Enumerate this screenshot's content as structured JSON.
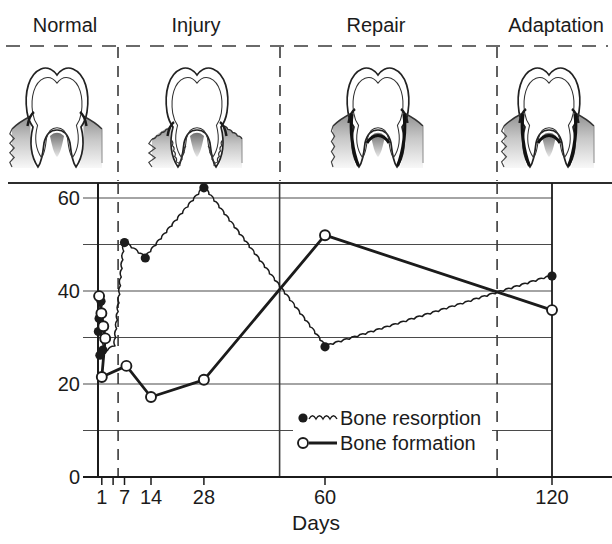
{
  "figure": {
    "phases": [
      {
        "label": "Normal"
      },
      {
        "label": "Injury"
      },
      {
        "label": "Repair"
      },
      {
        "label": "Adaptation"
      }
    ]
  },
  "chart_data": {
    "type": "line",
    "title": "",
    "xlabel": "Days",
    "ylabel": "",
    "x_ticks": [
      1,
      7,
      14,
      28,
      60,
      120
    ],
    "x_minor_ticks": [
      4
    ],
    "y_ticks": [
      0,
      20,
      40,
      60
    ],
    "y_gridlines": [
      10,
      20,
      30,
      40,
      50,
      60
    ],
    "xlim": [
      0,
      120
    ],
    "ylim": [
      0,
      63
    ],
    "grid": true,
    "legend_position": "inside-bottom-center",
    "phase_boundaries_days": [
      5.3,
      48,
      105.5
    ],
    "phase_boundary_styles": [
      "dashed",
      "solid",
      "dashed"
    ],
    "series": [
      {
        "name": "Bone resorption",
        "line_style": "wavy",
        "marker": "filled-circle",
        "color": "#1b1b1b",
        "points": [
          [
            0.8,
            37.8
          ],
          [
            0.3,
            34.1
          ],
          [
            0.1,
            31.3
          ],
          [
            1.3,
            27.3
          ],
          [
            0.5,
            26.2
          ],
          [
            4.5,
            28.2
          ],
          [
            7,
            50.4
          ],
          [
            12.5,
            47.1
          ],
          [
            28,
            62.2
          ],
          [
            60,
            28
          ],
          [
            120,
            43.2
          ]
        ],
        "unmarked_point_indices": [
          5
        ]
      },
      {
        "name": "Bone formation",
        "line_style": "solid",
        "marker": "open-circle",
        "color": "#1b1b1b",
        "points": [
          [
            0.3,
            38.9
          ],
          [
            0.9,
            35.2
          ],
          [
            1.4,
            32.4
          ],
          [
            1.9,
            29.8
          ],
          [
            1,
            21.5
          ],
          [
            7.5,
            23.9
          ],
          [
            14,
            17.2
          ],
          [
            28,
            20.9
          ],
          [
            60,
            52
          ],
          [
            120,
            35.9
          ]
        ],
        "unmarked_point_indices": []
      }
    ]
  }
}
